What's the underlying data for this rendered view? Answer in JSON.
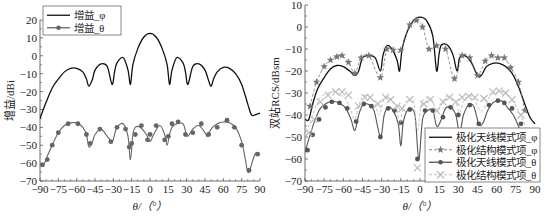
{
  "chart_data": [
    {
      "type": "line",
      "title": "",
      "xlabel": "θ/（°）",
      "ylabel": "增益/dBi",
      "xlim": [
        -90,
        90
      ],
      "ylim": [
        -70,
        20
      ],
      "xticks": [
        -90,
        -75,
        -60,
        -45,
        -30,
        -15,
        0,
        15,
        30,
        45,
        60,
        75,
        90
      ],
      "yticks": [
        20,
        10,
        0,
        -10,
        -20,
        -30,
        -40,
        -50,
        -60,
        -70
      ],
      "grid": false,
      "legend_position": "upper-left",
      "series": [
        {
          "name": "增益_φ",
          "style": "solid-black",
          "color": "#111111",
          "x": [
            -90,
            -85,
            -80,
            -75,
            -70,
            -65,
            -60,
            -55,
            -52,
            -50,
            -47,
            -45,
            -40,
            -35,
            -31,
            -29,
            -27,
            -22,
            -18,
            -16,
            -14,
            -10,
            -5,
            0,
            5,
            10,
            14,
            16,
            18,
            22,
            27,
            29,
            31,
            35,
            40,
            45,
            48,
            50,
            52,
            55,
            60,
            65,
            70,
            75,
            80,
            83,
            86,
            90
          ],
          "y": [
            -35,
            -26,
            -18,
            -13,
            -9,
            -7,
            -7,
            -9,
            -13,
            -17,
            -13,
            -8,
            -4.5,
            -6,
            -16,
            -9,
            -4,
            -1,
            -8,
            -16,
            -5,
            4,
            10.5,
            12.5,
            10.5,
            4,
            -5,
            -16,
            -8,
            -1,
            -4,
            -9,
            -16,
            -6,
            -4.5,
            -8,
            -14,
            -17,
            -13,
            -9,
            -6.5,
            -7,
            -10,
            -16,
            -27,
            -33,
            -33,
            -32
          ]
        },
        {
          "name": "增益_θ",
          "style": "gray-line-circle-markers",
          "color": "#666666",
          "x": [
            -90,
            -87,
            -84,
            -80,
            -75,
            -70,
            -65,
            -60,
            -55,
            -52,
            -50,
            -47,
            -45,
            -40,
            -35,
            -31,
            -29,
            -27,
            -22,
            -18,
            -16,
            -14,
            -12,
            -8,
            -3,
            0,
            3,
            8,
            12,
            14,
            16,
            18,
            22,
            27,
            29,
            31,
            35,
            40,
            45,
            47,
            50,
            55,
            60,
            65,
            70,
            75,
            78,
            80,
            82,
            86,
            90
          ],
          "y": [
            -61,
            -61,
            -56,
            -50,
            -43,
            -39,
            -37.5,
            -37.5,
            -40,
            -44,
            -51,
            -48,
            -44,
            -41,
            -45,
            -48,
            -44,
            -40,
            -38,
            -45,
            -58,
            -44,
            -40,
            -40,
            -44,
            -48,
            -44,
            -39,
            -44,
            -50,
            -44,
            -40,
            -38,
            -38,
            -42,
            -45,
            -41,
            -39,
            -43,
            -45,
            -41,
            -38,
            -37,
            -37.5,
            -40,
            -48,
            -58,
            -65,
            -63,
            -55,
            -55
          ],
          "markers_x": [
            -88,
            -84,
            -80,
            -75,
            -67,
            -59,
            -52,
            -49,
            -41,
            -32,
            -27,
            -20,
            -17,
            -15,
            -12,
            -7,
            -2,
            0,
            5,
            12,
            15,
            18,
            23,
            29,
            35,
            42,
            48,
            55,
            63,
            69,
            75,
            81,
            88
          ],
          "markers_y": [
            -61,
            -58,
            -50,
            -43,
            -38,
            -38,
            -44,
            -49,
            -41,
            -48,
            -40,
            -41,
            -51,
            -49,
            -44,
            -39,
            -47,
            -44,
            -39,
            -47,
            -45,
            -38,
            -37,
            -44,
            -43,
            -38,
            -44,
            -40,
            -36,
            -40,
            -50,
            -64,
            -55
          ]
        }
      ]
    },
    {
      "type": "line",
      "title": "",
      "xlabel": "θ/（°）",
      "ylabel": "双站RCS/dBsm",
      "xlim": [
        -90,
        90
      ],
      "ylim": [
        -70,
        10
      ],
      "xticks": [
        -90,
        -75,
        -60,
        -45,
        -30,
        -15,
        0,
        15,
        30,
        45,
        60,
        75,
        90
      ],
      "yticks": [
        10,
        0,
        -10,
        -20,
        -30,
        -40,
        -50,
        -60,
        -70
      ],
      "grid": false,
      "legend_position": "lower-right",
      "series": [
        {
          "name": "极化天线模式项_φ",
          "style": "solid-black",
          "color": "#111111",
          "x": [
            -90,
            -87,
            -84,
            -80,
            -75,
            -70,
            -65,
            -60,
            -55,
            -51,
            -48,
            -45,
            -40,
            -35,
            -31,
            -29,
            -26,
            -22,
            -18,
            -16,
            -14,
            -10,
            -5,
            0,
            5,
            10,
            13,
            15,
            17,
            22,
            26,
            29,
            31,
            35,
            40,
            45,
            48,
            52,
            57,
            62,
            67,
            72,
            77,
            82,
            86,
            90
          ],
          "y": [
            -42,
            -42,
            -35,
            -28,
            -23,
            -19,
            -17.5,
            -18,
            -20,
            -22,
            -20,
            -14,
            -13,
            -14,
            -20,
            -13,
            -8.5,
            -10,
            -15,
            -20,
            -10,
            -2,
            3,
            4.5,
            3,
            -4,
            -20,
            -12,
            -8,
            -8.5,
            -13,
            -20,
            -14,
            -13,
            -16,
            -22,
            -22,
            -18,
            -16.5,
            -16.5,
            -18,
            -21,
            -27,
            -35,
            -41,
            -44
          ]
        },
        {
          "name": "极化结构模式项_φ",
          "style": "gray-dashed-star-markers",
          "color": "#777777",
          "markers_x": [
            -86,
            -81,
            -75,
            -70,
            -65,
            -61,
            -56,
            -51,
            -46,
            -40,
            -31,
            -26,
            -21,
            -15,
            -8,
            -3,
            2,
            7,
            13,
            20,
            27,
            33,
            39,
            45,
            51,
            56,
            61,
            66,
            71,
            77,
            82
          ],
          "markers_y": [
            -36,
            -25,
            -18,
            -15,
            -13.5,
            -13,
            -16,
            -21,
            -14,
            -13,
            -23,
            -10,
            -10.5,
            -10.5,
            1,
            3,
            0,
            -10,
            -8.5,
            -10,
            -23.5,
            -13,
            -14,
            -22,
            -15.5,
            -13,
            -14,
            -14,
            -18.5,
            -25,
            -38
          ]
        },
        {
          "name": "极化天线模式项_θ",
          "style": "gray-line-circle-markers",
          "color": "#555555",
          "x": [
            -90,
            -86,
            -82,
            -78,
            -74,
            -70,
            -66,
            -62,
            -58,
            -54,
            -51,
            -48,
            -45,
            -41,
            -36,
            -31,
            -28,
            -25,
            -21,
            -17,
            -15,
            -13,
            -9,
            -4,
            -1,
            2,
            6,
            10,
            13,
            16,
            20,
            24,
            28,
            31,
            34,
            38,
            42,
            46,
            49,
            53,
            57,
            61,
            65,
            69,
            73,
            77,
            81,
            86,
            90
          ],
          "y": [
            -57,
            -49,
            -42,
            -37,
            -35,
            -34,
            -34,
            -35,
            -37,
            -42,
            -47,
            -40,
            -35.5,
            -35,
            -38,
            -50,
            -40,
            -36.5,
            -38,
            -44,
            -54,
            -43,
            -37.5,
            -40,
            -60,
            -42,
            -38,
            -38,
            -45,
            -43,
            -37,
            -36.5,
            -40,
            -48,
            -40,
            -35.5,
            -36,
            -44,
            -44,
            -38,
            -34.5,
            -33.5,
            -34,
            -37,
            -40,
            -45,
            -52,
            -60,
            -66
          ],
          "markers_x": [
            -88,
            -84,
            -79,
            -74,
            -69,
            -63,
            -57,
            -50,
            -44,
            -38,
            -31,
            -25,
            -20,
            -15,
            -8,
            -2,
            4,
            10,
            18,
            24,
            30,
            39,
            46,
            54,
            61,
            66,
            72,
            79,
            86
          ],
          "markers_y": [
            -56,
            -49,
            -42,
            -36.5,
            -34,
            -34.5,
            -37,
            -43,
            -35,
            -36,
            -50,
            -37,
            -38,
            -43.5,
            -37.5,
            -60,
            -38,
            -38,
            -41,
            -36.5,
            -40,
            -35.5,
            -44,
            -35.5,
            -33.5,
            -34.5,
            -37,
            -44,
            -53
          ]
        },
        {
          "name": "极化结构模式项_θ",
          "style": "lightgray-dashed-x-markers",
          "color": "#bbbbbb",
          "x": [
            -90,
            -86,
            -82,
            -78,
            -74,
            -70,
            -66,
            -62,
            -58,
            -54,
            -51,
            -48,
            -45,
            -41,
            -36,
            -32,
            -29,
            -26,
            -22,
            -18,
            -16,
            -13,
            -9,
            -5,
            -2,
            1,
            5,
            9,
            13,
            16,
            20,
            24,
            28,
            31,
            34,
            38,
            42,
            46,
            49,
            53,
            57,
            61,
            65,
            69,
            73,
            77,
            81,
            86,
            90
          ],
          "y": [
            -50,
            -43,
            -37,
            -32,
            -30.5,
            -29.5,
            -29.5,
            -31,
            -33,
            -38,
            -42,
            -36,
            -31.5,
            -31.5,
            -34,
            -40,
            -34,
            -32,
            -33,
            -37,
            -45,
            -36,
            -33,
            -34,
            -47,
            -35,
            -32.5,
            -33,
            -38,
            -36,
            -32,
            -31.5,
            -34,
            -39,
            -34,
            -31.5,
            -32,
            -37,
            -38,
            -33,
            -30.5,
            -29.5,
            -29.5,
            -31,
            -34,
            -38,
            -43,
            -50,
            -56
          ],
          "markers_x": [
            -87,
            -83,
            -78,
            -72,
            -66,
            -61,
            -56,
            -48,
            -43,
            -39,
            -33,
            -27,
            -23,
            -18,
            -14,
            -8,
            -2,
            3,
            8,
            13,
            18,
            23,
            28,
            33,
            38,
            43,
            50,
            57,
            62,
            67,
            72,
            79,
            86
          ],
          "markers_y": [
            -48,
            -42,
            -34,
            -31,
            -29.5,
            -29.5,
            -31,
            -36,
            -32,
            -32,
            -35,
            -32,
            -33,
            -36,
            -37,
            -33,
            -64,
            -35,
            -33,
            -38,
            -34,
            -32,
            -34,
            -32,
            -31.5,
            -32,
            -32.5,
            -29.5,
            -29,
            -30,
            -33,
            -40,
            -49
          ]
        }
      ]
    }
  ],
  "charts": {
    "left": {
      "ylabel": "增益/dBi",
      "xlabel": "θ/（°）",
      "legend": [
        "增益_φ",
        "增益_θ"
      ]
    },
    "right": {
      "ylabel": "双站RCS/dBsm",
      "xlabel": "θ/（°）",
      "legend": [
        "极化天线模式项_φ",
        "极化结构模式项_φ",
        "极化天线模式项_θ",
        "极化结构模式项_θ"
      ]
    }
  }
}
